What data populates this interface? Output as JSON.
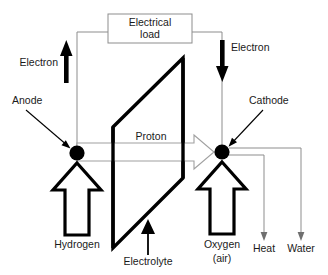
{
  "figure": {
    "type": "diagram"
  },
  "load": {
    "line1": "Electrical",
    "line2": "load"
  },
  "electrodes": {
    "anode": "Anode",
    "cathode": "Cathode"
  },
  "electrons": {
    "left": "Electron",
    "right": "Electron"
  },
  "membrane": {
    "proton": "Proton",
    "electrolyte": "Electrolyte"
  },
  "inputs": {
    "fuel": "Hydrogen",
    "oxidant_line1": "Oxygen",
    "oxidant_line2": "(air)"
  },
  "outputs": {
    "heat": "Heat",
    "water": "Water"
  },
  "colors": {
    "ink": "#000000",
    "wire": "#8d8d8d",
    "text": "#1a1a1a",
    "background": "#ffffff"
  }
}
